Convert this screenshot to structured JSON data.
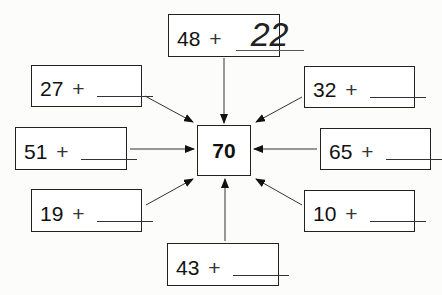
{
  "diagram": {
    "target": "70",
    "operator": "+",
    "boxes": [
      {
        "position": "top",
        "addend": "48",
        "answer": "22"
      },
      {
        "position": "top-left",
        "addend": "27",
        "answer": ""
      },
      {
        "position": "top-right",
        "addend": "32",
        "answer": ""
      },
      {
        "position": "left",
        "addend": "51",
        "answer": ""
      },
      {
        "position": "right",
        "addend": "65",
        "answer": ""
      },
      {
        "position": "bottom-left",
        "addend": "19",
        "answer": ""
      },
      {
        "position": "bottom-right",
        "addend": "10",
        "answer": ""
      },
      {
        "position": "bottom",
        "addend": "43",
        "answer": ""
      }
    ],
    "colors": {
      "line": "#222222",
      "background": "#fcfcfa"
    }
  }
}
